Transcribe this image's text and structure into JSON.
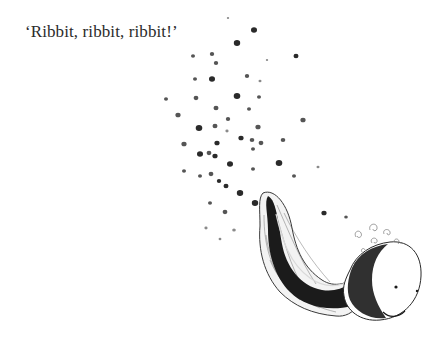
{
  "page": {
    "caption": "‘Ribbit, ribbit, ribbit!’"
  },
  "illustration": {
    "subject": "tadpole",
    "colors": {
      "ink": "#1a1a1a",
      "dot_dark": "#2a2a2a",
      "dot_mid": "#555555",
      "dot_light": "#8a8a8a",
      "background": "#ffffff"
    },
    "dots": [
      [
        228,
        18,
        1.2,
        "l"
      ],
      [
        254,
        30,
        3,
        "d"
      ],
      [
        237,
        43,
        3.2,
        "d"
      ],
      [
        193,
        56,
        2,
        "m"
      ],
      [
        212,
        54,
        2.2,
        "m"
      ],
      [
        216,
        63,
        2.2,
        "m"
      ],
      [
        296,
        56,
        2.5,
        "d"
      ],
      [
        267,
        60,
        1.2,
        "l"
      ],
      [
        195,
        79,
        2,
        "m"
      ],
      [
        212,
        79,
        3,
        "d"
      ],
      [
        247,
        76,
        2.2,
        "m"
      ],
      [
        260,
        81,
        1.5,
        "l"
      ],
      [
        166,
        99,
        2,
        "m"
      ],
      [
        196,
        98,
        2.4,
        "m"
      ],
      [
        237,
        96,
        3.3,
        "d"
      ],
      [
        259,
        97,
        2,
        "m"
      ],
      [
        216,
        108,
        2.5,
        "m"
      ],
      [
        178,
        115,
        2.6,
        "m"
      ],
      [
        303,
        120,
        2.6,
        "m"
      ],
      [
        228,
        119,
        2.2,
        "m"
      ],
      [
        249,
        109,
        2,
        "m"
      ],
      [
        199,
        128,
        3.3,
        "d"
      ],
      [
        215,
        126,
        2.5,
        "m"
      ],
      [
        227,
        131,
        1.6,
        "l"
      ],
      [
        258,
        127,
        2.6,
        "m"
      ],
      [
        184,
        144,
        2.6,
        "m"
      ],
      [
        241,
        138,
        2.6,
        "d"
      ],
      [
        217,
        143,
        2.6,
        "d"
      ],
      [
        200,
        154,
        3,
        "d"
      ],
      [
        209,
        153,
        2.4,
        "m"
      ],
      [
        215,
        156,
        2.6,
        "d"
      ],
      [
        252,
        140,
        2.3,
        "m"
      ],
      [
        261,
        143,
        2.4,
        "m"
      ],
      [
        283,
        140,
        2.3,
        "m"
      ],
      [
        230,
        164,
        3,
        "d"
      ],
      [
        279,
        163,
        3.3,
        "d"
      ],
      [
        253,
        149,
        2,
        "m"
      ],
      [
        184,
        171,
        2,
        "m"
      ],
      [
        200,
        176,
        2,
        "m"
      ],
      [
        211,
        174,
        2.4,
        "m"
      ],
      [
        219,
        181,
        2.2,
        "d"
      ],
      [
        253,
        169,
        2,
        "m"
      ],
      [
        294,
        176,
        2,
        "m"
      ],
      [
        240,
        193,
        3.2,
        "d"
      ],
      [
        255,
        203,
        3.2,
        "d"
      ],
      [
        226,
        186,
        2.5,
        "d"
      ],
      [
        318,
        167,
        1.5,
        "l"
      ],
      [
        210,
        203,
        2,
        "m"
      ],
      [
        225,
        212,
        2.4,
        "m"
      ],
      [
        279,
        208,
        1.5,
        "l"
      ],
      [
        234,
        230,
        1.8,
        "l"
      ],
      [
        324,
        213,
        2.6,
        "d"
      ],
      [
        346,
        217,
        1.8,
        "m"
      ],
      [
        206,
        228,
        1.6,
        "l"
      ],
      [
        220,
        239,
        1.4,
        "l"
      ]
    ]
  }
}
